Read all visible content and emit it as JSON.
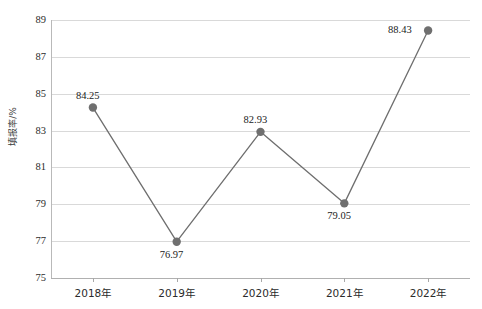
{
  "chart_data": {
    "type": "line",
    "title": "",
    "subtitle": "",
    "xlabel": "",
    "ylabel": "填报率/%",
    "categories": [
      "2018年",
      "2019年",
      "2020年",
      "2021年",
      "2022年"
    ],
    "values": [
      84.25,
      76.97,
      82.93,
      79.05,
      88.43
    ],
    "series": [
      {
        "name": "填报率",
        "values": [
          84.25,
          76.97,
          82.93,
          79.05,
          88.43
        ]
      }
    ],
    "point_labels": [
      "84.25",
      "76.97",
      "82.93",
      "79.05",
      "88.43"
    ],
    "point_label_positions": [
      "above",
      "below",
      "above",
      "below",
      "left"
    ],
    "ylim": [
      75,
      89
    ],
    "y_ticks": [
      89,
      87,
      85,
      83,
      81,
      79,
      77,
      75
    ],
    "y_tick_labels": [
      "89",
      "87",
      "85",
      "83",
      "81",
      "79",
      "77",
      "75"
    ],
    "grid": true,
    "grid_axis": "y",
    "legend": false,
    "legend_position": "none",
    "colors": {
      "line": "#6e6e6e",
      "marker": "#6f6f6f",
      "gridline": "#d9d9d9",
      "axis": "#b0b0b0",
      "text": "#2b2b2b",
      "background": "#ffffff"
    },
    "marker_style": "circle",
    "line_width": 1.3,
    "marker_size": 4.2
  }
}
